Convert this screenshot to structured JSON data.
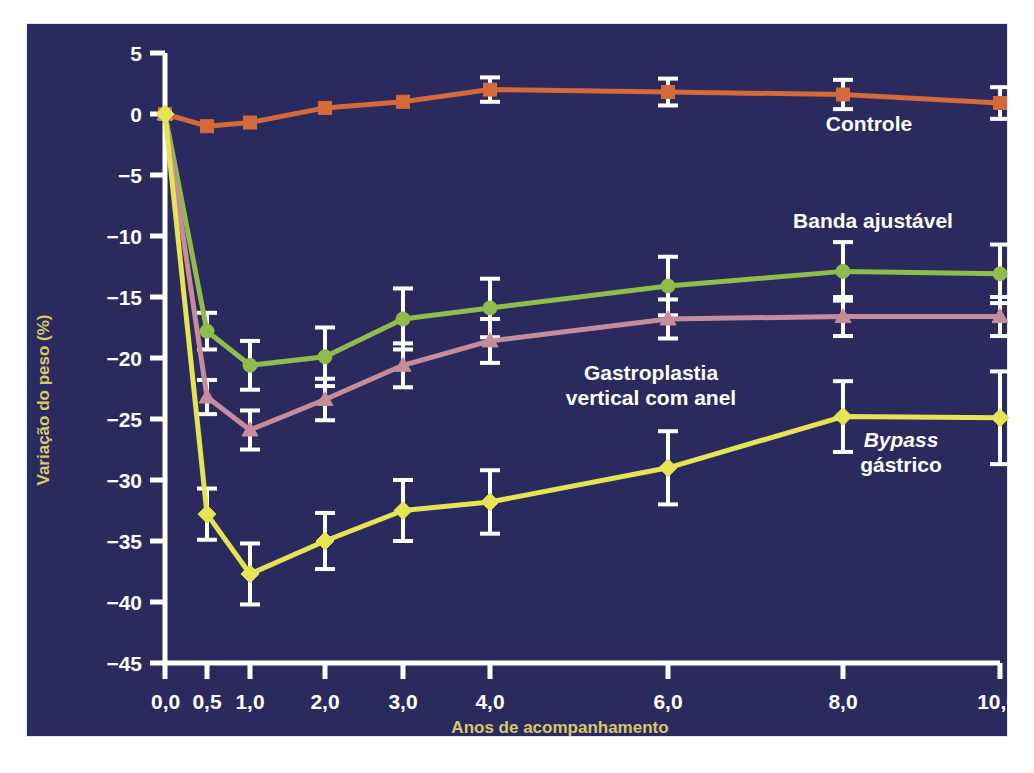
{
  "chart_data": {
    "type": "line",
    "title": "",
    "xlabel": "Anos de acompanhamento",
    "ylabel": "Variação do peso (%)",
    "x": [
      0.0,
      0.5,
      1.0,
      2.0,
      3.0,
      4.0,
      6.0,
      8.0,
      10.0
    ],
    "xtick_labels": [
      "0,0",
      "0,5",
      "1,0",
      "2,0",
      "3,0",
      "4,0",
      "6,0",
      "8,0",
      "10,0"
    ],
    "ytick_labels": [
      "5",
      "0",
      "−5",
      "−10",
      "−15",
      "−20",
      "−25",
      "−30",
      "−35",
      "−40",
      "−45"
    ],
    "ytick_values": [
      5,
      0,
      -5,
      -10,
      -15,
      -20,
      -25,
      -30,
      -35,
      -40,
      -45
    ],
    "ylim": [
      -45,
      5
    ],
    "grid": false,
    "legend_position": "inline-annotations",
    "background_color": "#2b2a5e",
    "axis_color": "#ffffff",
    "errorbar_color": "#ffffff",
    "series": [
      {
        "name": "Controle",
        "color": "#d4693a",
        "marker": "square",
        "label_text": "Controle",
        "values": [
          0.0,
          -1.0,
          -0.7,
          0.5,
          1.0,
          2.0,
          1.8,
          1.6,
          0.9
        ],
        "errors": [
          0.0,
          0.0,
          0.0,
          0.0,
          0.0,
          1.0,
          1.1,
          1.2,
          1.3
        ]
      },
      {
        "name": "Banda ajustável",
        "color": "#8fbc4a",
        "marker": "circle",
        "label_text": "Banda ajustável",
        "values": [
          0.0,
          -17.8,
          -20.6,
          -19.9,
          -16.8,
          -15.9,
          -14.1,
          -12.9,
          -13.1
        ],
        "errors": [
          0.0,
          1.5,
          2.0,
          2.4,
          2.5,
          2.4,
          2.4,
          2.4,
          2.4
        ]
      },
      {
        "name": "Gastroplastia vertical com anel",
        "color": "#c58c9b",
        "marker": "triangle",
        "label_text": "Gastroplastia\nvertical com anel",
        "values": [
          0.0,
          -23.2,
          -25.9,
          -23.4,
          -20.6,
          -18.6,
          -16.8,
          -16.6,
          -16.6
        ],
        "errors": [
          0.0,
          1.4,
          1.6,
          1.7,
          1.8,
          1.8,
          1.6,
          1.6,
          1.6
        ]
      },
      {
        "name": "Bypass gástrico",
        "color": "#e4e455",
        "marker": "diamond",
        "label_text": "Bypass gástrico",
        "values": [
          0.0,
          -32.8,
          -37.7,
          -35.0,
          -32.5,
          -31.8,
          -29.0,
          -24.8,
          -24.9
        ],
        "errors": [
          0.0,
          2.1,
          2.5,
          2.3,
          2.5,
          2.6,
          3.0,
          2.9,
          3.8
        ]
      }
    ],
    "annotations": [
      {
        "id": "label-controle",
        "text": "Controle",
        "x_px": 869,
        "y_px": 131,
        "anchor": "middle",
        "italic": false
      },
      {
        "id": "label-banda-ajustavel",
        "text": "Banda ajustável",
        "x_px": 873,
        "y_px": 228,
        "anchor": "middle",
        "italic": false
      },
      {
        "id": "label-gastroplastia-line1",
        "text": "Gastroplastia",
        "x_px": 651,
        "y_px": 380,
        "anchor": "middle",
        "italic": false
      },
      {
        "id": "label-gastroplastia-line2",
        "text": "vertical com anel",
        "x_px": 651,
        "y_px": 405,
        "anchor": "middle",
        "italic": false
      },
      {
        "id": "label-bypass-line1",
        "text": "Bypass",
        "x_px": 901,
        "y_px": 447,
        "anchor": "middle",
        "italic": true
      },
      {
        "id": "label-bypass-line2",
        "text": "gástrico",
        "x_px": 901,
        "y_px": 472,
        "anchor": "middle",
        "italic": false
      }
    ]
  }
}
